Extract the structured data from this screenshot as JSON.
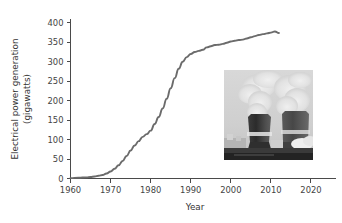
{
  "chart_data": {
    "type": "line",
    "title": "",
    "xlabel": "Year",
    "ylabel": "Electrical power generation (gigawatts)",
    "ylabel_line1": "Electrical power generation",
    "ylabel_line2": "(gigawatts)",
    "xlim": [
      1960,
      2023
    ],
    "ylim": [
      0,
      410
    ],
    "grid": false,
    "legend": null,
    "line_color": "#6b6b6b",
    "axis_color": "#4a4a4a",
    "xticks": [
      1960,
      1970,
      1980,
      1990,
      2000,
      2010,
      2020
    ],
    "xtick_labels": [
      "1960",
      "1970",
      "1980",
      "1990",
      "2000",
      "2010",
      "2020"
    ],
    "yticks": [
      0,
      50,
      100,
      150,
      200,
      250,
      300,
      350,
      400
    ],
    "ytick_labels": [
      "0",
      "50",
      "100",
      "150",
      "200",
      "250",
      "300",
      "350",
      "400"
    ],
    "series": [
      {
        "name": "Nuclear electrical power generation",
        "x": [
          1960,
          1962,
          1964,
          1965,
          1966,
          1967,
          1968,
          1969,
          1970,
          1971,
          1972,
          1973,
          1974,
          1975,
          1976,
          1977,
          1978,
          1979,
          1980,
          1981,
          1982,
          1983,
          1984,
          1985,
          1986,
          1987,
          1988,
          1989,
          1990,
          1991,
          1992,
          1993,
          1994,
          1995,
          1996,
          1997,
          1998,
          1999,
          2000,
          2001,
          2002,
          2003,
          2004,
          2005,
          2006,
          2007,
          2008,
          2009,
          2010,
          2011,
          2012
        ],
        "values": [
          1,
          2,
          3,
          4,
          5,
          7,
          9,
          13,
          18,
          25,
          34,
          45,
          58,
          72,
          85,
          96,
          107,
          114,
          123,
          140,
          158,
          180,
          205,
          232,
          258,
          282,
          300,
          312,
          320,
          325,
          328,
          331,
          337,
          340,
          343,
          344,
          346,
          349,
          352,
          354,
          356,
          357,
          360,
          363,
          366,
          369,
          371,
          373,
          375,
          378,
          374
        ]
      }
    ],
    "inset_image": {
      "name": "nuclear-cooling-towers-photo",
      "description": "Black and white photograph of two nuclear power plant cooling towers emitting steam plumes",
      "x": 224,
      "y": 70,
      "width": 89,
      "height": 90
    }
  }
}
